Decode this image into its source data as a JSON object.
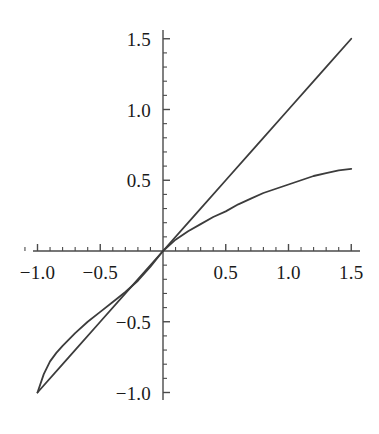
{
  "figure": {
    "background_color": "#ffffff",
    "curve_color": "#3c3c3c",
    "axis_color": "#4a4a4a",
    "width": 379,
    "height": 434
  },
  "chart_data": {
    "type": "line",
    "title": "",
    "subtitle": "",
    "xlabel": "",
    "ylabel": "",
    "xlim": [
      -1.15,
      1.55
    ],
    "ylim": [
      -1.1,
      1.55
    ],
    "grid": false,
    "legend": "none",
    "axes_style": "cross-through-origin",
    "x_ticks_major": [
      -1.0,
      -0.5,
      0.5,
      1.0,
      1.5
    ],
    "x_tick_labels": [
      "-1.0",
      "-0.5",
      "0.5",
      "1.0",
      "1.5"
    ],
    "y_ticks_major": [
      1.5,
      1.0,
      0.5,
      -0.5,
      -1.0
    ],
    "y_tick_labels": [
      "1.5",
      "1.0",
      "0.5",
      "-0.5",
      "-1.0"
    ],
    "x_ticks_minor": [
      -1.1,
      -0.9,
      -0.8,
      -0.7,
      -0.6,
      -0.4,
      -0.3,
      -0.2,
      -0.1,
      0.1,
      0.2,
      0.3,
      0.4,
      0.6,
      0.7,
      0.8,
      0.9,
      1.1,
      1.2,
      1.3,
      1.4
    ],
    "y_ticks_minor": [
      1.4,
      1.3,
      1.2,
      1.1,
      0.9,
      0.8,
      0.7,
      0.6,
      0.4,
      0.3,
      0.2,
      0.1,
      -0.1,
      -0.2,
      -0.3,
      -0.4,
      -0.6,
      -0.7,
      -0.8,
      -0.9
    ],
    "series": [
      {
        "name": "identity-line",
        "style": "solid",
        "color": "#3c3c3c",
        "x": [
          -1.0,
          -0.75,
          -0.5,
          -0.25,
          0.0,
          0.25,
          0.5,
          0.75,
          1.0,
          1.25,
          1.5
        ],
        "values": [
          -1.0,
          -0.75,
          -0.5,
          -0.25,
          0.0,
          0.25,
          0.5,
          0.75,
          1.0,
          1.25,
          1.5
        ]
      },
      {
        "name": "concave-curve",
        "style": "solid",
        "color": "#3c3c3c",
        "x": [
          -1.0,
          -0.95,
          -0.9,
          -0.85,
          -0.8,
          -0.7,
          -0.6,
          -0.5,
          -0.4,
          -0.3,
          -0.2,
          -0.1,
          0.0,
          0.1,
          0.2,
          0.3,
          0.4,
          0.5,
          0.6,
          0.7,
          0.8,
          0.9,
          1.0,
          1.1,
          1.2,
          1.3,
          1.4,
          1.5
        ],
        "values": [
          -1.0,
          -0.87,
          -0.78,
          -0.72,
          -0.67,
          -0.58,
          -0.5,
          -0.43,
          -0.36,
          -0.29,
          -0.21,
          -0.11,
          0.0,
          0.08,
          0.14,
          0.19,
          0.24,
          0.28,
          0.33,
          0.37,
          0.41,
          0.44,
          0.47,
          0.5,
          0.53,
          0.55,
          0.57,
          0.58
        ]
      }
    ],
    "annotations": []
  },
  "axes_geometry": {
    "origin_x_px": 163,
    "origin_y_px": 251,
    "x_scale_px_per_unit": 125.5,
    "y_scale_px_per_unit": 141.5,
    "x_axis_start_px": 33,
    "x_axis_end_px": 360,
    "y_axis_top_px": 30,
    "y_axis_bottom_px": 400,
    "major_tick_len_px": 7,
    "minor_tick_len_px": 4
  },
  "tick_label_offsets": {
    "x_label_dy_px": 12,
    "y_label_dx_px": -12
  }
}
